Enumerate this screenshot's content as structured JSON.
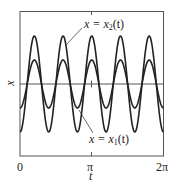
{
  "chart_data": {
    "type": "line",
    "title": "",
    "xlabel": "t",
    "ylabel": "x",
    "xlim": [
      0,
      6.2832
    ],
    "x_ticks": [
      {
        "value": 0,
        "label": "0"
      },
      {
        "value": 3.1416,
        "label": "π"
      },
      {
        "value": 6.2832,
        "label": "2π"
      }
    ],
    "grid": false,
    "legend": "none (inline annotations)",
    "series": [
      {
        "name": "x = x2(t)",
        "label_main": "x = x",
        "label_sub": "2",
        "label_tail": "(t)",
        "formula": "-2 cos(5t)",
        "amplitude": 2,
        "frequency": 5,
        "color": "#222222"
      },
      {
        "name": "x = x1(t)",
        "label_main": "x = x",
        "label_sub": "1",
        "label_tail": "(t)",
        "formula": "-1 cos(5t)",
        "amplitude": 1,
        "frequency": 5,
        "color": "#222222"
      }
    ],
    "annotations": [
      {
        "text": "x = x2(t)",
        "points_to": "x2 curve, second peak"
      },
      {
        "text": "x = x1(t)",
        "points_to": "x1 curve, second trough"
      }
    ]
  },
  "labels": {
    "x2_main": "x = x",
    "x2_sub": "2",
    "x2_tail": "(t)",
    "x1_main": "x = x",
    "x1_sub": "1",
    "x1_tail": "(t)",
    "tick_0": "0",
    "tick_pi": "π",
    "tick_2pi": "2π",
    "xlabel": "t",
    "ylabel": "x"
  }
}
